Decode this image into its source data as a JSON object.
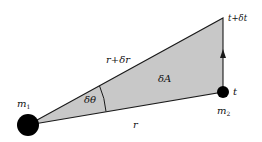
{
  "diagram": {
    "type": "kepler-area-sweep",
    "colors": {
      "background": "#ffffff",
      "sector_fill": "#c8c8c8",
      "stroke": "#1a1a1a",
      "mass": "#000000"
    },
    "masses": [
      {
        "id": "m1",
        "label": "m",
        "subscript": "1",
        "cx": 28,
        "cy": 125,
        "r": 11
      },
      {
        "id": "m2",
        "label": "m",
        "subscript": "2",
        "cx": 223,
        "cy": 92,
        "r": 6
      }
    ],
    "vertices": {
      "origin": [
        28,
        125
      ],
      "at_t": [
        223,
        92
      ],
      "at_t_plus_dt": [
        223,
        18
      ]
    },
    "labels": {
      "m1": "m",
      "m1_sub": "1",
      "m2": "m",
      "m2_sub": "2",
      "t": "t",
      "t_plus_dt": "t+δt",
      "r_plus_dr": "r+δr",
      "r": "r",
      "dA": "δA",
      "dtheta": "δθ"
    }
  }
}
